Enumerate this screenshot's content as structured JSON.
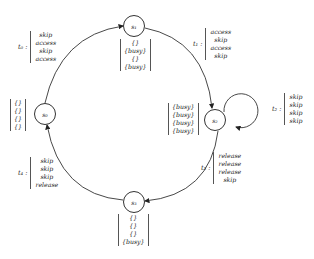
{
  "nodes": {
    "s0": {
      "label": "s₀",
      "stack": [
        "{}",
        "{}",
        "{}",
        "{}"
      ]
    },
    "s1": {
      "label": "s₁",
      "stack": [
        "{}",
        "{busy}",
        "{}",
        "{busy}"
      ]
    },
    "s2": {
      "label": "s₂",
      "stack": [
        "{busy}",
        "{busy}",
        "{busy}",
        "{busy}"
      ]
    },
    "s3": {
      "label": "s₃",
      "stack": [
        "{}",
        "{}",
        "{}",
        "{busy}"
      ]
    }
  },
  "transitions": {
    "t0": {
      "label": "t₀ :",
      "from": "s0",
      "to": "s1",
      "actions": [
        "skip",
        "access",
        "skip",
        "access"
      ]
    },
    "t1": {
      "label": "t₁ :",
      "from": "s1",
      "to": "s2",
      "actions": [
        "access",
        "skip",
        "access",
        "skip"
      ]
    },
    "t2": {
      "label": "t₂ :",
      "from": "s2",
      "to": "s2",
      "actions": [
        "skip",
        "skip",
        "skip",
        "skip"
      ]
    },
    "t3": {
      "label": "t₃ :",
      "from": "s2",
      "to": "s3",
      "actions": [
        "release",
        "release",
        "release",
        "skip"
      ]
    },
    "t4": {
      "label": "t₄ :",
      "from": "s3",
      "to": "s0",
      "actions": [
        "skip",
        "skip",
        "skip",
        "release"
      ]
    }
  }
}
